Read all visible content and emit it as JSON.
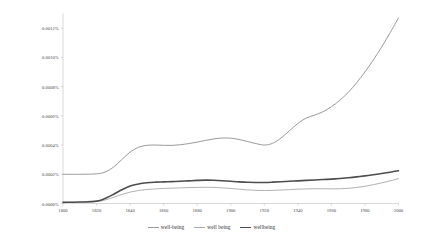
{
  "chart_data": {
    "type": "line",
    "title": "",
    "subtitle": "",
    "xlabel": "",
    "ylabel": "",
    "xlim": [
      1800,
      2000
    ],
    "ylim": [
      0.0,
      0.0013
    ],
    "grid": false,
    "legend_position": "bottom-center",
    "y_tick_labels": [
      "0.0012%",
      "0.0010%",
      "0.0008%",
      "0.0006%",
      "0.0004%",
      "0.0002%",
      "0.0000%"
    ],
    "y_tick_values": [
      0.0012,
      0.001,
      0.0008,
      0.0006,
      0.0004,
      0.0002,
      0.0
    ],
    "x_tick_labels": [
      "1800",
      "1820",
      "1840",
      "1860",
      "1880",
      "1900",
      "1920",
      "1940",
      "1960",
      "1980",
      "2000"
    ],
    "x_tick_values": [
      1800,
      1820,
      1840,
      1860,
      1880,
      1900,
      1920,
      1940,
      1960,
      1980,
      2000
    ],
    "x": [
      1800,
      1810,
      1820,
      1825,
      1830,
      1835,
      1840,
      1845,
      1850,
      1855,
      1860,
      1865,
      1870,
      1875,
      1880,
      1885,
      1890,
      1895,
      1900,
      1905,
      1910,
      1915,
      1920,
      1925,
      1930,
      1935,
      1940,
      1945,
      1950,
      1955,
      1960,
      1965,
      1970,
      1975,
      1980,
      1985,
      1990,
      1995,
      2000
    ],
    "series": [
      {
        "name": "well-being",
        "color": "#9a9a9a",
        "width": 1.0,
        "values": [
          0.0002,
          0.0002,
          0.000203,
          0.000215,
          0.000248,
          0.0003,
          0.000352,
          0.000385,
          0.000398,
          0.0004,
          0.000398,
          0.000398,
          0.000402,
          0.00041,
          0.00042,
          0.000432,
          0.000442,
          0.000448,
          0.000447,
          0.000438,
          0.000424,
          0.00041,
          0.0004,
          0.000412,
          0.000448,
          0.000498,
          0.000548,
          0.000585,
          0.000605,
          0.000628,
          0.000662,
          0.000706,
          0.00076,
          0.000826,
          0.0009,
          0.000982,
          0.001072,
          0.001168,
          0.00127
        ]
      },
      {
        "name": "well being",
        "color": "#a8a8a8",
        "width": 0.9,
        "values": [
          8e-06,
          1e-05,
          1.4e-05,
          2.4e-05,
          4.2e-05,
          6.2e-05,
          7.8e-05,
          8.9e-05,
          9.6e-05,
          0.0001,
          0.000103,
          0.000105,
          0.000107,
          0.000109,
          0.00011,
          0.000111,
          0.00011,
          0.000107,
          0.000103,
          9.8e-05,
          9.3e-05,
          9e-05,
          8.9e-05,
          9e-05,
          9.2e-05,
          9.5e-05,
          9.8e-05,
          0.0001,
          0.000101,
          0.000101,
          0.0001,
          0.000101,
          0.000104,
          0.00011,
          0.000118,
          0.000129,
          0.000141,
          0.000155,
          0.00017
        ]
      },
      {
        "name": "wellbeing",
        "color": "#4d4d4d",
        "width": 1.6,
        "values": [
          8e-06,
          1e-05,
          1.6e-05,
          3.4e-05,
          6.2e-05,
          9.4e-05,
          0.00012,
          0.000134,
          0.000142,
          0.000146,
          0.000148,
          0.00015,
          0.000152,
          0.000155,
          0.000158,
          0.00016,
          0.000159,
          0.000156,
          0.000152,
          0.000148,
          0.000145,
          0.000144,
          0.000144,
          0.000146,
          0.000149,
          0.000152,
          0.000155,
          0.000158,
          0.000161,
          0.000164,
          0.000167,
          0.000171,
          0.000176,
          0.000182,
          0.000189,
          0.000197,
          0.000205,
          0.000214,
          0.000224
        ]
      }
    ]
  },
  "legend": {
    "items": [
      {
        "label": "well-being"
      },
      {
        "label": "well being"
      },
      {
        "label": "wellbeing"
      }
    ]
  },
  "axes": {
    "axis_line_color": "#bfbfbf"
  }
}
